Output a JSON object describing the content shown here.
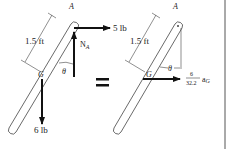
{
  "fbd": {
    "point_a": "A",
    "point_g": "G",
    "length": "1.5 ft",
    "force_h": "5 lb",
    "normal": "N",
    "normal_sub": "A",
    "theta": "θ",
    "weight": "6 lb"
  },
  "equals": "=",
  "kd": {
    "point_a": "A",
    "point_g": "G",
    "length": "1.5 ft",
    "theta": "θ",
    "frac_num": "6",
    "frac_den": "32.2",
    "accel": "a",
    "accel_sub": "G"
  }
}
